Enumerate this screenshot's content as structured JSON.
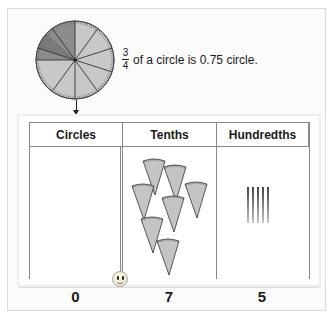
{
  "caption": {
    "numerator": "3",
    "denominator": "4",
    "text": "of a circle is 0.75 circle."
  },
  "circle": {
    "sectors": 10,
    "fraction_shown": 0.75,
    "light_color": "#c8c8c8",
    "dark_color": "#8c8c8c"
  },
  "table": {
    "headers": [
      "Circles",
      "Tenths",
      "Hundredths"
    ],
    "totals": [
      "0",
      "7",
      "5"
    ],
    "tenths_count": 7,
    "hundredths_count": 5
  },
  "colors": {
    "wedge_fill": "#c4c4c4",
    "border": "#888888"
  }
}
